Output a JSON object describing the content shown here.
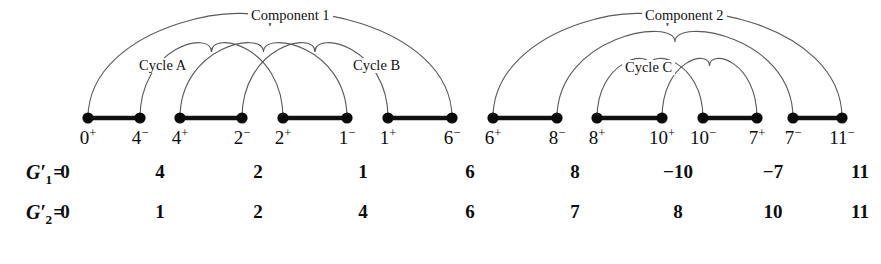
{
  "figure": {
    "type": "breakpoint-graph-diagram",
    "baseline_y": 118,
    "label_y": 128,
    "components": [
      {
        "id": "component-1",
        "caption": "Component 1",
        "caption_x": 248,
        "caption_y": 8,
        "cycles": [
          {
            "id": "cycle-a",
            "caption": "Cycle A",
            "caption_x": 136,
            "caption_y": 58
          },
          {
            "id": "cycle-b",
            "caption": "Cycle B",
            "caption_x": 350,
            "caption_y": 58
          }
        ],
        "vertices": [
          {
            "id": "v0p",
            "label": "0",
            "sign": "+",
            "x": 88
          },
          {
            "id": "v4m",
            "label": "4",
            "sign": "−",
            "x": 140
          },
          {
            "id": "v4p",
            "label": "4",
            "sign": "+",
            "x": 180
          },
          {
            "id": "v2m",
            "label": "2",
            "sign": "−",
            "x": 242
          },
          {
            "id": "v2p",
            "label": "2",
            "sign": "+",
            "x": 283
          },
          {
            "id": "v1m",
            "label": "1",
            "sign": "−",
            "x": 347
          },
          {
            "id": "v1p",
            "label": "1",
            "sign": "+",
            "x": 388
          },
          {
            "id": "v6m",
            "label": "6",
            "sign": "−",
            "x": 452
          }
        ],
        "segments": [
          {
            "from": 88,
            "to": 140
          },
          {
            "from": 180,
            "to": 242
          },
          {
            "from": 283,
            "to": 347
          },
          {
            "from": 388,
            "to": 452
          }
        ],
        "arcs": [
          {
            "from": 88,
            "to": 452,
            "height": 92
          },
          {
            "from": 140,
            "to": 283,
            "height": 66
          },
          {
            "from": 180,
            "to": 347,
            "height": 66
          },
          {
            "from": 242,
            "to": 388,
            "height": 66
          }
        ]
      },
      {
        "id": "component-2",
        "caption": "Component 2",
        "caption_x": 642,
        "caption_y": 8,
        "cycles": [
          {
            "id": "cycle-c",
            "caption": "Cycle C",
            "caption_x": 622,
            "caption_y": 60
          }
        ],
        "vertices": [
          {
            "id": "v6p",
            "label": "6",
            "sign": "+",
            "x": 493
          },
          {
            "id": "v8m",
            "label": "8",
            "sign": "−",
            "x": 557
          },
          {
            "id": "v8p",
            "label": "8",
            "sign": "+",
            "x": 597
          },
          {
            "id": "v10p",
            "label": "10",
            "sign": "+",
            "x": 662
          },
          {
            "id": "v10m",
            "label": "10",
            "sign": "−",
            "x": 703
          },
          {
            "id": "v7p",
            "label": "7",
            "sign": "+",
            "x": 757
          },
          {
            "id": "v7m",
            "label": "7",
            "sign": "−",
            "x": 793
          },
          {
            "id": "v11m",
            "label": "11",
            "sign": "−",
            "x": 842
          }
        ],
        "segments": [
          {
            "from": 493,
            "to": 557
          },
          {
            "from": 597,
            "to": 662
          },
          {
            "from": 703,
            "to": 757
          },
          {
            "from": 793,
            "to": 842
          }
        ],
        "arcs": [
          {
            "from": 493,
            "to": 842,
            "height": 92
          },
          {
            "from": 557,
            "to": 793,
            "height": 76
          },
          {
            "from": 597,
            "to": 703,
            "height": 52
          },
          {
            "from": 662,
            "to": 757,
            "height": 52
          }
        ]
      }
    ],
    "rows": [
      {
        "id": "row-g1",
        "name_base": "G",
        "name_sub": "1",
        "name_prime": "′",
        "equals": "=",
        "name_x": 26,
        "y": 162,
        "values": [
          {
            "text": "0",
            "x": 65
          },
          {
            "text": "4",
            "x": 160
          },
          {
            "text": "2",
            "x": 258
          },
          {
            "text": "1",
            "x": 363
          },
          {
            "text": "6",
            "x": 470
          },
          {
            "text": "8",
            "x": 575
          },
          {
            "text": "−10",
            "x": 678
          },
          {
            "text": "−7",
            "x": 773
          },
          {
            "text": "11",
            "x": 860
          }
        ]
      },
      {
        "id": "row-g2",
        "name_base": "G",
        "name_sub": "2",
        "name_prime": "′",
        "equals": "=",
        "name_x": 26,
        "y": 202,
        "values": [
          {
            "text": "0",
            "x": 65
          },
          {
            "text": "1",
            "x": 160
          },
          {
            "text": "2",
            "x": 258
          },
          {
            "text": "4",
            "x": 363
          },
          {
            "text": "6",
            "x": 470
          },
          {
            "text": "7",
            "x": 575
          },
          {
            "text": "8",
            "x": 678
          },
          {
            "text": "10",
            "x": 773
          },
          {
            "text": "11",
            "x": 860
          }
        ]
      }
    ],
    "colors": {
      "arc_stroke": "#5a5a5a",
      "segment_stroke": "#101010",
      "dot_fill": "#0a0a0a",
      "text": "#0d0d0d",
      "background": "#ffffff"
    }
  }
}
